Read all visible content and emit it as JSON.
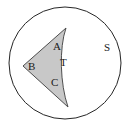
{
  "figure": {
    "type": "geometry-diagram",
    "background_color": "#ffffff",
    "circle": {
      "name": "S",
      "center_x": 65,
      "center_y": 63,
      "radius": 56,
      "stroke_color": "#262626",
      "stroke_width": 1,
      "fill_color": "#ffffff"
    },
    "region": {
      "name": "T",
      "fill_color": "#c8c8c8",
      "stroke_color": "#4d4d4d",
      "stroke_width": 1,
      "vertices": [
        {
          "label": "A",
          "x": 66,
          "y": 28
        },
        {
          "label": "B",
          "x": 23,
          "y": 66
        },
        {
          "label": "C",
          "x": 68,
          "y": 107
        }
      ],
      "right_edge": "concave",
      "path": "M 66 28 L 23 66 L 68 107 C 60 84 59 48 66 28 Z"
    },
    "labels": {
      "a": "A",
      "b": "B",
      "c": "C",
      "t": "T",
      "s": "S"
    }
  }
}
